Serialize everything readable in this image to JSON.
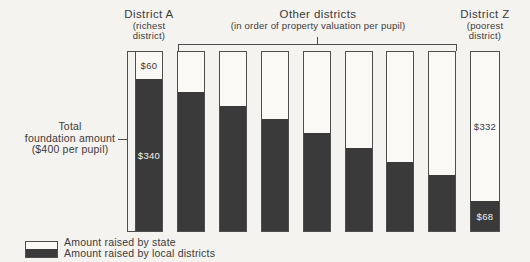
{
  "figure": {
    "district_a": {
      "title": "District A",
      "sub1": "(richest",
      "sub2": "district)"
    },
    "other_districts": {
      "title": "Other districts",
      "sub": "(in order of property valuation per pupil)"
    },
    "district_z": {
      "title": "District Z",
      "sub1": "(poorest",
      "sub2": "district)"
    },
    "y_label": {
      "line1": "Total",
      "line2": "foundation amount",
      "line3": "($400 per pupil)"
    },
    "legend": {
      "state": "Amount raised by state",
      "local": "Amount raised by local districts"
    },
    "colors": {
      "paper": "#f4f3ef",
      "bar_fill": "#3a3a3a",
      "bar_white": "#faf9f6",
      "line": "#4e4e4e",
      "text": "#3b3b3b",
      "label_on_dark": "#f2f1ed"
    }
  },
  "chart_data": {
    "type": "bar",
    "stacked": true,
    "total_per_pupil": 400,
    "ylim": [
      0,
      400
    ],
    "series_names": [
      "Amount raised by state",
      "Amount raised by local districts"
    ],
    "series": [
      {
        "name": "Amount raised by state",
        "values": [
          60,
          90,
          120,
          150,
          180,
          215,
          245,
          275,
          332
        ]
      },
      {
        "name": "Amount raised by local districts",
        "values": [
          340,
          310,
          280,
          250,
          220,
          185,
          155,
          125,
          68
        ]
      }
    ],
    "bars": [
      {
        "category": "District A",
        "state": 60,
        "local": 340,
        "state_label": "$60",
        "local_label": "$340"
      },
      {
        "category": "Other district 1",
        "state": 90,
        "local": 310,
        "estimated": true
      },
      {
        "category": "Other district 2",
        "state": 120,
        "local": 280,
        "estimated": true
      },
      {
        "category": "Other district 3",
        "state": 150,
        "local": 250,
        "estimated": true
      },
      {
        "category": "Other district 4",
        "state": 180,
        "local": 220,
        "estimated": true
      },
      {
        "category": "Other district 5",
        "state": 215,
        "local": 185,
        "estimated": true
      },
      {
        "category": "Other district 6",
        "state": 245,
        "local": 155,
        "estimated": true
      },
      {
        "category": "Other district 7",
        "state": 275,
        "local": 125,
        "estimated": true
      },
      {
        "category": "District Z",
        "state": 332,
        "local": 68,
        "state_label": "$332",
        "local_label": "$68"
      }
    ]
  }
}
